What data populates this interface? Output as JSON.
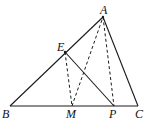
{
  "diagram": {
    "type": "geometry-triangle",
    "points": {
      "A": {
        "label": "A",
        "x": 103,
        "y": 17
      },
      "B": {
        "label": "B",
        "x": 10,
        "y": 106
      },
      "C": {
        "label": "C",
        "x": 138,
        "y": 106
      },
      "E": {
        "label": "E",
        "x": 65,
        "y": 52
      },
      "M": {
        "label": "M",
        "x": 72,
        "y": 106
      },
      "P": {
        "label": "P",
        "x": 114,
        "y": 106
      }
    },
    "solid_segments": [
      "AB",
      "AC",
      "BC",
      "EP"
    ],
    "dashed_segments": [
      "EM",
      "MA",
      "AP"
    ],
    "colors": {
      "line": "#1a1a1a",
      "background": "#ffffff"
    }
  }
}
